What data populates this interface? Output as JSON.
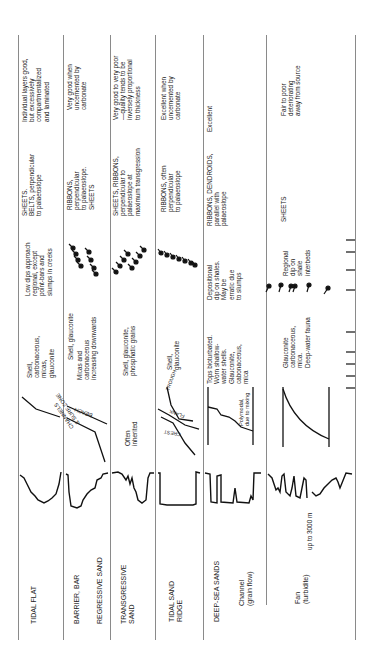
{
  "table": {
    "orientation": "rotated-90-ccw",
    "columns": [
      "Environment",
      "Gamma-ray log",
      "Grain-size trend",
      "Components",
      "Dipmeter pattern",
      "Geometry",
      "Reservoir quality"
    ],
    "rows": [
      {
        "environment": "TIDAL FLAT",
        "trend": "",
        "components": "Shell,\ncarbonaceous,\nmicas,\nglauconite",
        "dips": "Low dips approach\nregional, except\npoint-bars and\nslumps in creeks",
        "geometry": "SHEETS.\nBELTS, perpendicular\nto palaeoslope",
        "quality": "Individual layers good,\nbut excessively\ncompartmentalized\nand laminated"
      },
      {
        "environment": "BARRIER, BAR",
        "environment_sub": "REGRESSIVE SAND",
        "trend_labels": [
          "BEACH",
          "CHANNELS\n& SURF ZONE"
        ],
        "components": "Shell, glauconite",
        "components_sub": "Micas and\ncarbonaceous\nincreasing downwards",
        "dips": "",
        "geometry": "RIBBONS,\nperpendicular\nto palaeoslope.\nSHEETS",
        "quality": "Very good when\nuncemented by\ncarbonate"
      },
      {
        "environment": "TRANSGRESSIVE\nSAND",
        "trend_text": "Often\ninherited",
        "components": "Shell, glauconite,\nphosphatic grains",
        "dips": "",
        "geometry": "SHEETS, RIBBONS,\nperpendicular to\npalaeoslope at\nmaximum transgression",
        "quality": "Very good to very poor\n—quality tends to be\ninversely proportional\nto thickness"
      },
      {
        "environment": "TIDAL SAND\nRIDGE",
        "trend_labels": [
          "TROUGH",
          "FLANK",
          "CREST"
        ],
        "components": "Shell,\nglauconite",
        "dips": "",
        "geometry": "RIBBONS, often\nperpendicular\nto palaeoslope",
        "quality": "Excellent when\nuncemented by\ncarbonate"
      },
      {
        "environment": "DEEP-SEA SANDS",
        "environment_sub": "Channel\n(grain flow)",
        "trend_text": "Polymodal,\ndue to mixing",
        "components": "Tops bioturbated.\nWorn shallow-\nwater shells.\nGlauconite,\ncabonaceous,\nmica",
        "dips": "Depositional\ndip on shales.\nMay be\nerratic due\nto slumps",
        "geometry": "RIBBONS, DENDROIDS,\nparallel with\npalaeoslope",
        "quality": "Excellent"
      },
      {
        "environment": "",
        "environment_sub": "Fan\n(turbidite)",
        "log_note": "up to 3000 m",
        "components": "Glauconite\ncarbonaceous,\nmica.\nDeep-water fauna",
        "dips": "Regional\ndip on\nshale\ninterbeds",
        "geometry": "SHEETS",
        "quality": "Fair to poor\ndeteriorating\naway from source"
      }
    ]
  }
}
